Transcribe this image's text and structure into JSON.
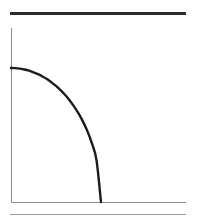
{
  "figure": {
    "title": "",
    "background_color": "#ffffff",
    "width": 198,
    "height": 223
  },
  "top_rule": {
    "name": "top-rule",
    "color": "#2b2b2b",
    "thickness": 3,
    "x_start": 10,
    "x_end": 186,
    "y": 12
  },
  "bottom_rule": {
    "name": "bottom-rule",
    "color": "#9a9a9a",
    "thickness": 1,
    "x_start": 10,
    "x_end": 186,
    "y": 214
  },
  "axes": {
    "color": "#8c8c8c",
    "thickness": 1,
    "origin_x": 11,
    "origin_y": 202,
    "y_axis_top": 28,
    "x_axis_right": 186,
    "x_tick_labels": [],
    "y_tick_labels": [],
    "xlabel": "",
    "ylabel": ""
  },
  "chart_data": {
    "type": "line",
    "title": "",
    "subtitle": "",
    "xlabel": "",
    "ylabel": "",
    "xlim": [
      0,
      1
    ],
    "ylim": [
      0,
      1
    ],
    "grid": false,
    "legend": null,
    "annotations": [],
    "axis_tick_labels": {
      "x": [],
      "y": []
    },
    "series": [
      {
        "name": "curve",
        "color": "#1c1c1c",
        "linewidth": 2.4,
        "shape": "concave-down decreasing quarter-ellipse arc",
        "description": "Smooth decreasing curve starting on the y-axis and falling to meet the x-axis; slope steepens toward the right.",
        "x": [
          0.0,
          0.05,
          0.1,
          0.15,
          0.2,
          0.25,
          0.3,
          0.35,
          0.4,
          0.45,
          0.5,
          0.55,
          0.6,
          0.65,
          0.7,
          0.75,
          0.8,
          0.85,
          0.9,
          0.95,
          1.0
        ],
        "y": [
          1.0,
          0.999,
          0.995,
          0.989,
          0.98,
          0.968,
          0.954,
          0.937,
          0.917,
          0.893,
          0.866,
          0.835,
          0.8,
          0.76,
          0.714,
          0.661,
          0.6,
          0.527,
          0.436,
          0.312,
          0.0
        ],
        "pixel_points": [
          [
            11,
            68
          ],
          [
            29,
            84
          ],
          [
            50,
            108
          ],
          [
            64,
            124
          ],
          [
            78,
            145
          ],
          [
            90,
            170
          ],
          [
            101,
            202
          ]
        ]
      }
    ]
  }
}
